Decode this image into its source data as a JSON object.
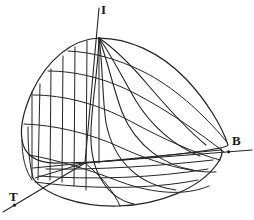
{
  "figure": {
    "background_color": "#ffffff",
    "line_color": "#242424"
  },
  "axes": [
    {
      "id": "I",
      "label": "I",
      "name": "vertical-axis-I",
      "direction": "up",
      "origin": [
        85,
        163
      ],
      "tip": [
        99,
        8
      ],
      "tick_marker": false
    },
    {
      "id": "B",
      "label": "B",
      "name": "right-axis-B",
      "direction": "right",
      "origin": [
        85,
        163
      ],
      "tip": [
        252,
        150
      ],
      "tick_marker": true
    },
    {
      "id": "T",
      "label": "T",
      "name": "left-axis-T",
      "direction": "lower-left",
      "origin": [
        85,
        163
      ],
      "tip": [
        3,
        212
      ],
      "tick_marker": true
    }
  ],
  "chart_data": {
    "type": "surface-mesh",
    "title": "",
    "xlabel": "T",
    "ylabel": "B",
    "zlabel": "I",
    "grid": true,
    "legend": null,
    "apex": [
      99,
      38
    ],
    "surface_outline": "M 99 38 C 72 39 47 60 32 92 C 23 112 20 128 22 140 C 24 154 35 163 55 163 C 95 163 150 158 195 152 C 218 149 227 147 228 145 C 222 126 206 100 186 79 C 160 52 128 38 99 38 Z",
    "base_ellipse": "M 32 177 C 44 195 80 207 118 206 C 160 205 200 188 217 164 C 222 157 223 152 221 149",
    "ridge_curves": [
      {
        "name": "ridge-1",
        "d": "M 99 38 C 115 49 132 66 148 85 C 166 106 186 129 206 145"
      },
      {
        "name": "ridge-2",
        "d": "M 99 38 C 112 56 123 79 136 101 C 152 127 176 147 200 156"
      },
      {
        "name": "ridge-3",
        "d": "M 99 38 C 108 62 113 88 122 112 C 136 147 166 166 193 170"
      },
      {
        "name": "ridge-4",
        "d": "M 99 38 C 103 66 102 96 106 123 C 114 163 140 185 176 190"
      },
      {
        "name": "ridge-5",
        "d": "M 99 38 C 98 70 92 102 91 130 C 89 175 110 199 134 204"
      }
    ],
    "cross_curves": [
      {
        "name": "cross-1",
        "d": "M 68 51 C 92 52 118 59 144 72 C 172 86 202 112 226 141"
      },
      {
        "name": "cross-2",
        "d": "M 48 71 C 77 71 108 79 138 95 C 170 112 201 134 224 152"
      },
      {
        "name": "cross-3",
        "d": "M 33 95 C 64 95 98 104 130 121 C 165 140 197 154 220 160"
      },
      {
        "name": "cross-4",
        "d": "M 24 124 C 54 125 90 133 122 148 C 157 164 192 173 216 172"
      },
      {
        "name": "cross-5",
        "d": "M 29 155 C 58 160 90 170 121 182 C 154 194 186 196 209 186"
      }
    ],
    "vertical_lines": [
      {
        "name": "vline-1",
        "x_top": 40,
        "y_top": 84,
        "x_bot": 38,
        "y_bot": 180
      },
      {
        "name": "vline-2",
        "x_top": 51,
        "y_top": 69,
        "x_bot": 50,
        "y_bot": 180
      },
      {
        "name": "vline-3",
        "x_top": 63,
        "y_top": 56,
        "x_bot": 62,
        "y_bot": 182
      },
      {
        "name": "vline-4",
        "x_top": 75,
        "y_top": 47,
        "x_bot": 74,
        "y_bot": 186
      },
      {
        "name": "vline-5",
        "x_top": 87,
        "y_top": 41,
        "x_bot": 86,
        "y_bot": 190
      },
      {
        "name": "vline-6",
        "x_top": 99,
        "y_top": 38,
        "x_bot": 99,
        "y_bot": 163
      }
    ],
    "floor_grid": [
      {
        "name": "floor-radial-1",
        "d": "M 85 163 L 35 178"
      },
      {
        "name": "floor-radial-2",
        "d": "M 85 163 L 33 168"
      },
      {
        "name": "floor-radial-3",
        "d": "M 85 163 C 100 175 113 190 120 206"
      },
      {
        "name": "floor-chord-1",
        "d": "M 85 163 L 221 150"
      },
      {
        "name": "floor-chord-2",
        "d": "M 46 169 C 96 170 160 166 213 160"
      },
      {
        "name": "floor-chord-3",
        "d": "M 39 176 C 90 180 155 178 208 169"
      },
      {
        "name": "floor-chord-4",
        "d": "M 35 182 C 86 189 148 190 198 180"
      }
    ],
    "left_face_edges": [
      {
        "name": "left-face-edge-1",
        "d": "M 22 140 C 22 156 25 170 32 180"
      },
      {
        "name": "left-face-edge-2",
        "d": "M 28 127 C 28 146 29 163 33 177"
      },
      {
        "name": "left-face-vert",
        "d": "M 32 92 L 32 177"
      }
    ]
  }
}
